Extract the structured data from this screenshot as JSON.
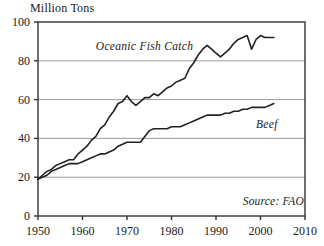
{
  "chart_data": {
    "type": "line",
    "title": "",
    "ylabel": "Million Tons",
    "xlabel": "",
    "xlim": [
      1950,
      2010
    ],
    "ylim": [
      0,
      100
    ],
    "grid": true,
    "legend_position": "inline-annotation",
    "xticks": [
      "1950",
      "1960",
      "1970",
      "1980",
      "1990",
      "2000",
      "2010"
    ],
    "yticks": [
      "0",
      "20",
      "40",
      "60",
      "80",
      "100"
    ],
    "annotations": [
      {
        "text": "Oceanic Fish Catch",
        "x": 1963,
        "y": 87
      },
      {
        "text": "Beef",
        "x": 1999,
        "y": 47
      },
      {
        "text": "Source: FAO",
        "x": 1996,
        "y": 7
      }
    ],
    "series": [
      {
        "name": "Oceanic Fish Catch",
        "color": "#222222",
        "x": [
          1950,
          1951,
          1952,
          1953,
          1954,
          1955,
          1956,
          1957,
          1958,
          1959,
          1960,
          1961,
          1962,
          1963,
          1964,
          1965,
          1966,
          1967,
          1968,
          1969,
          1970,
          1971,
          1972,
          1973,
          1974,
          1975,
          1976,
          1977,
          1978,
          1979,
          1980,
          1981,
          1982,
          1983,
          1984,
          1985,
          1986,
          1987,
          1988,
          1989,
          1990,
          1991,
          1992,
          1993,
          1994,
          1995,
          1996,
          1997,
          1998,
          1999,
          2000,
          2001,
          2002,
          2003
        ],
        "values": [
          19,
          21,
          23,
          24,
          26,
          27,
          28,
          29,
          29,
          32,
          34,
          36,
          39,
          41,
          45,
          47,
          51,
          54,
          58,
          59,
          62,
          59,
          57,
          59,
          61,
          61,
          63,
          62,
          64,
          66,
          67,
          69,
          70,
          71,
          76,
          79,
          83,
          86,
          88,
          86,
          84,
          82,
          84,
          86,
          89,
          91,
          92,
          93,
          86,
          91,
          93,
          92,
          92,
          92
        ]
      },
      {
        "name": "Beef",
        "color": "#222222",
        "x": [
          1950,
          1951,
          1952,
          1953,
          1954,
          1955,
          1956,
          1957,
          1958,
          1959,
          1960,
          1961,
          1962,
          1963,
          1964,
          1965,
          1966,
          1967,
          1968,
          1969,
          1970,
          1971,
          1972,
          1973,
          1974,
          1975,
          1976,
          1977,
          1978,
          1979,
          1980,
          1981,
          1982,
          1983,
          1984,
          1985,
          1986,
          1987,
          1988,
          1989,
          1990,
          1991,
          1992,
          1993,
          1994,
          1995,
          1996,
          1997,
          1998,
          1999,
          2000,
          2001,
          2002,
          2003
        ],
        "values": [
          19,
          20,
          21,
          23,
          24,
          25,
          26,
          27,
          27,
          27,
          28,
          29,
          30,
          31,
          32,
          32,
          33,
          34,
          36,
          37,
          38,
          38,
          38,
          38,
          41,
          44,
          45,
          45,
          45,
          45,
          46,
          46,
          46,
          47,
          48,
          49,
          50,
          51,
          52,
          52,
          52,
          52,
          53,
          53,
          54,
          54,
          55,
          55,
          56,
          56,
          56,
          56,
          57,
          58
        ]
      }
    ]
  },
  "axis": {
    "ylabel": "Million Tons"
  }
}
